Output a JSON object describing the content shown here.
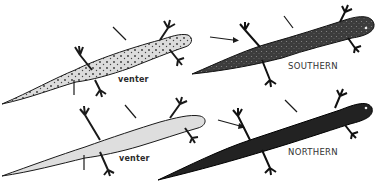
{
  "figure": {
    "labels": {
      "top_left_venter": "venter",
      "top_right_form": "SOUTHERN",
      "bottom_left_venter": "venter",
      "bottom_right_form": "NORTHERN"
    },
    "panels": [
      {
        "id": "top-left",
        "view": "venter",
        "tone": "light-spotted"
      },
      {
        "id": "top-right",
        "view": "dorsal",
        "form": "SOUTHERN",
        "tone": "dark-speckled"
      },
      {
        "id": "bottom-left",
        "view": "venter",
        "tone": "light-pale"
      },
      {
        "id": "bottom-right",
        "view": "dorsal",
        "form": "NORTHERN",
        "tone": "dark"
      }
    ],
    "colors": {
      "background": "#ffffff",
      "ink": "#1a1a1a",
      "light_body": "#d9d9d9",
      "dark_body": "#3a3a3a",
      "darkest_body": "#1e1e1e"
    }
  }
}
